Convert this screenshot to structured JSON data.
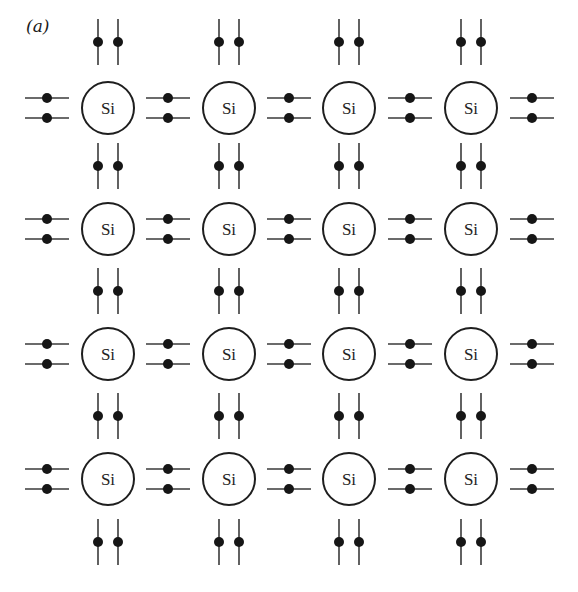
{
  "figure": {
    "panel_label": "(a)",
    "atom_symbol": "Si",
    "rows": 4,
    "columns": 4,
    "atom_count": 16,
    "colors": {
      "background": "#ffffff",
      "atom_stroke": "#1e1e1e",
      "bond_line": "#3a3a3a",
      "electron": "#161616"
    }
  },
  "layout": {
    "columns_x": [
      108,
      229,
      349,
      471
    ],
    "rows_y": [
      108,
      229,
      354,
      479
    ],
    "atom_radius": 26,
    "horizontal_bond_centers_x": [
      47,
      168,
      289,
      410,
      532
    ],
    "vertical_bond_centers_y": [
      42,
      166,
      291,
      416,
      542
    ],
    "bond_pair_offset": 10,
    "horizontal_bond_half_length": 22,
    "vertical_bond_half_length": 23,
    "electron_radius": 5
  },
  "atoms": [
    {
      "row": 1,
      "col": 1,
      "label": "Si"
    },
    {
      "row": 1,
      "col": 2,
      "label": "Si"
    },
    {
      "row": 1,
      "col": 3,
      "label": "Si"
    },
    {
      "row": 1,
      "col": 4,
      "label": "Si"
    },
    {
      "row": 2,
      "col": 1,
      "label": "Si"
    },
    {
      "row": 2,
      "col": 2,
      "label": "Si"
    },
    {
      "row": 2,
      "col": 3,
      "label": "Si"
    },
    {
      "row": 2,
      "col": 4,
      "label": "Si"
    },
    {
      "row": 3,
      "col": 1,
      "label": "Si"
    },
    {
      "row": 3,
      "col": 2,
      "label": "Si"
    },
    {
      "row": 3,
      "col": 3,
      "label": "Si"
    },
    {
      "row": 3,
      "col": 4,
      "label": "Si"
    },
    {
      "row": 4,
      "col": 1,
      "label": "Si"
    },
    {
      "row": 4,
      "col": 2,
      "label": "Si"
    },
    {
      "row": 4,
      "col": 3,
      "label": "Si"
    },
    {
      "row": 4,
      "col": 4,
      "label": "Si"
    }
  ]
}
